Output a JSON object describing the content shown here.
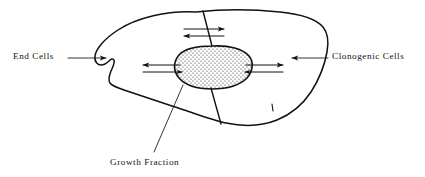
{
  "figure": {
    "background_color": "#ffffff",
    "ink_color": "#111111",
    "width": 425,
    "height": 177
  },
  "labels": {
    "end_cells": "End Cells",
    "clonogenic_cells": "Clonogenic Cells",
    "growth_fraction": "Growth Fraction"
  },
  "regions": {
    "outer_shape_name": "tumour-mass-outline",
    "inner_shape_name": "growth-fraction-region",
    "inner_fill_pattern": "stipple-dots"
  },
  "arrows": {
    "top_pair": [
      {
        "name": "top-arrow-rightward",
        "direction": "right"
      },
      {
        "name": "top-arrow-leftward",
        "direction": "left"
      }
    ],
    "left_pair": [
      {
        "name": "left-arrow-outward",
        "direction": "left"
      },
      {
        "name": "left-arrow-inward",
        "direction": "right"
      }
    ],
    "right_pair": [
      {
        "name": "right-arrow-outward",
        "direction": "right"
      },
      {
        "name": "right-arrow-inward",
        "direction": "left"
      }
    ],
    "callouts": [
      {
        "name": "end-cells-callout-arrow",
        "direction": "right"
      },
      {
        "name": "clonogenic-cells-callout-arrow",
        "direction": "left"
      }
    ]
  }
}
